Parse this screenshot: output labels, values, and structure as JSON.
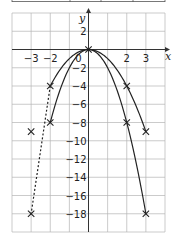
{
  "chart_data": {
    "type": "line",
    "title": "",
    "xlabel": "x",
    "ylabel": "y",
    "xlim": [
      -4,
      4
    ],
    "ylim": [
      -20,
      4
    ],
    "grid": true,
    "x_ticks": [
      -3,
      -2,
      0,
      2,
      3
    ],
    "x_tick_labels": [
      "−3",
      "−2",
      "0",
      "2",
      "3"
    ],
    "y_ticks": [
      2,
      -2,
      -4,
      -6,
      -8,
      -10,
      -12,
      -14,
      -16,
      -18
    ],
    "y_tick_labels": [
      "2",
      "−2",
      "−4",
      "−6",
      "−8",
      "−10",
      "−12",
      "−14",
      "−16",
      "−18"
    ],
    "series": [
      {
        "name": "y = −x²",
        "style": "solid",
        "x": [
          -2,
          -1,
          0,
          1,
          2,
          3
        ],
        "y": [
          -4,
          -1,
          0,
          -1,
          -4,
          -9
        ]
      },
      {
        "name": "y = −2x²",
        "style": "solid",
        "x": [
          -2,
          -1,
          0,
          1,
          2,
          3
        ],
        "y": [
          -8,
          -2,
          0,
          -2,
          -8,
          -18
        ]
      },
      {
        "name": "dashed segment",
        "style": "dashed",
        "x": [
          -2,
          -3
        ],
        "y": [
          -4,
          -18
        ]
      }
    ],
    "markers": [
      {
        "x": -3,
        "y": -9
      },
      {
        "x": -2,
        "y": -4
      },
      {
        "x": -2,
        "y": -8
      },
      {
        "x": 0,
        "y": 0
      },
      {
        "x": 2,
        "y": -4
      },
      {
        "x": 2,
        "y": -8
      },
      {
        "x": 3,
        "y": -9
      },
      {
        "x": -3,
        "y": -18
      },
      {
        "x": 3,
        "y": -18
      }
    ],
    "colors": {
      "line": "#222222",
      "grid": "#b5b5b5",
      "axis": "#333333"
    }
  }
}
